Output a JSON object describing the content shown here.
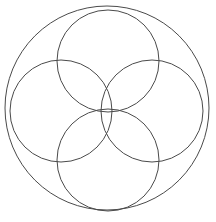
{
  "figure": {
    "title": "Overlapping circles rosette",
    "canvas": {
      "width": 216,
      "height": 222
    },
    "background_color": "#ffffff",
    "stroke_color": "#4a4a4a",
    "stroke_width": 1
  },
  "chart_data": {
    "type": "diagram",
    "title": "Overlapping circles rosette",
    "subtitle": "",
    "xlabel": "",
    "ylabel": "",
    "xlim": [
      0,
      216
    ],
    "ylim": [
      0,
      222
    ],
    "grid": false,
    "legend": "none",
    "units": "pixels",
    "center_point": {
      "x": 108,
      "y": 111
    },
    "shapes": [
      {
        "name": "outer-circle",
        "kind": "circle",
        "cx": 107,
        "cy": 108,
        "r": 102,
        "stroke": "#4a4a4a",
        "stroke_width": 1,
        "fill": "none"
      },
      {
        "name": "top-circle",
        "kind": "circle",
        "cx": 108,
        "cy": 61,
        "r": 51,
        "stroke": "#4a4a4a",
        "stroke_width": 1,
        "fill": "none"
      },
      {
        "name": "left-circle",
        "kind": "circle",
        "cx": 61,
        "cy": 111,
        "r": 51,
        "stroke": "#4a4a4a",
        "stroke_width": 1,
        "fill": "none"
      },
      {
        "name": "right-circle",
        "kind": "circle",
        "cx": 152,
        "cy": 111,
        "r": 51,
        "stroke": "#4a4a4a",
        "stroke_width": 1,
        "fill": "none"
      },
      {
        "name": "bottom-circle",
        "kind": "circle",
        "cx": 108,
        "cy": 160,
        "r": 51,
        "stroke": "#4a4a4a",
        "stroke_width": 1,
        "fill": "none"
      }
    ],
    "counts": {
      "total_circles": 5,
      "outer_circles": 1,
      "inner_circles": 4
    }
  }
}
